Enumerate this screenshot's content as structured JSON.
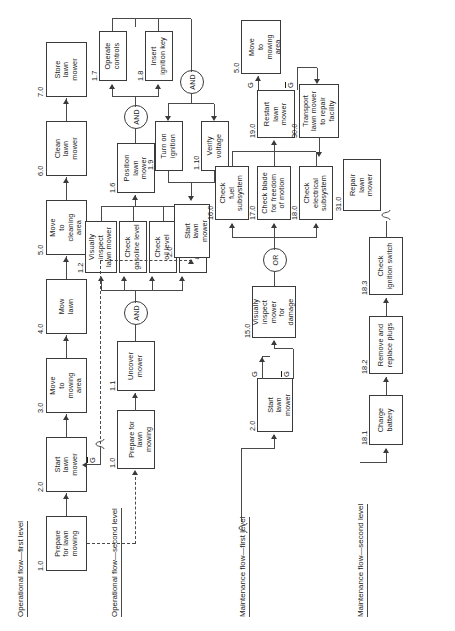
{
  "diagram": {
    "orientation": "rotated-90-ccw",
    "gate_and": "AND",
    "gate_or": "OR",
    "ref_word": "Ref.",
    "signal_true": "G",
    "signal_false": "G"
  },
  "flow_labels": {
    "operational_first": "Operational flow—first level",
    "operational_second": "Operational flow—second level",
    "maintenance_first": "Maintenance flow—first level",
    "maintenance_second": "Maintenance flow—second level"
  },
  "blocks": {
    "b1_0": {
      "num": "1.0",
      "text": "Prepare\nfor lawn\nmowing"
    },
    "b2_0": {
      "num": "2.0",
      "text": "Start\nlawn\nmower"
    },
    "b3_0": {
      "num": "3.0",
      "text": "Move\nto\nmowing\narea"
    },
    "b4_0": {
      "num": "4.0",
      "text": "Mow\nlawn"
    },
    "b5_0": {
      "num": "5.0",
      "text": "Move\nto\ncleaning\narea"
    },
    "b6_0": {
      "num": "6.0",
      "text": "Clean\nlawn\nmower"
    },
    "b7_0": {
      "num": "7.0",
      "text": "Store\nlawn\nmower"
    },
    "r1_0": {
      "num": "1.0",
      "text": "Prepare for\nlawn\nmowing"
    },
    "b1_1": {
      "num": "1.1",
      "text": "Uncover\nmower"
    },
    "b1_2": {
      "num": "1.2",
      "text": "Visually\ninspect\nlawn mower"
    },
    "b1_3": {
      "num": "1.3",
      "text": "Check\ngasoline level"
    },
    "b1_4": {
      "num": "1.4",
      "text": "Check\noil level"
    },
    "b1_5": {
      "num": "1.5",
      "text": "Check\nair filter"
    },
    "b1_6": {
      "num": "1.6",
      "text": "Position\nlawn\nmower"
    },
    "b1_7": {
      "num": "1.7",
      "text": "Operate\ncontrols"
    },
    "b1_8": {
      "num": "1.8",
      "text": "Insert\nignition key"
    },
    "b1_9": {
      "num": "1.9",
      "text": "Turn on\nignition"
    },
    "b1_10": {
      "num": "1.10",
      "text": "Verify\nvoltage"
    },
    "r2_0_top": {
      "num": "2.0",
      "text": "Start\nlawn\nmower"
    },
    "r2_0_maint": {
      "num": "2.0",
      "text": "Start\nlawn\nmower"
    },
    "b15_0": {
      "num": "15.0",
      "text": "Visually\ninspect\nmower\nfor\ndamage"
    },
    "b16_0": {
      "num": "16.0",
      "text": "Check\nfuel\nsubsystem"
    },
    "b17_0": {
      "num": "17.0",
      "text": "Check blade\nfor freedom\nof motion"
    },
    "b18_0": {
      "num": "18.0",
      "text": "Check\nelectrical\nsubsystem"
    },
    "b19_0": {
      "num": "19.0",
      "text": "Restart\nlawn\nmower"
    },
    "r5_0": {
      "num": "5.0",
      "text": "Move\nto\nmowing\narea"
    },
    "b30_0": {
      "num": "30.0",
      "text": "Transport\nlawn mower\nto repair\nfacility"
    },
    "b31_0": {
      "num": "31.0",
      "text": "Repair\nlawn\nmower"
    },
    "b18_1": {
      "num": "18.1",
      "text": "Charge\nbattery"
    },
    "b18_2": {
      "num": "18.2",
      "text": "Remove and\nreplace plugs"
    },
    "b18_3": {
      "num": "18.3",
      "text": "Check\nignition switch"
    }
  }
}
